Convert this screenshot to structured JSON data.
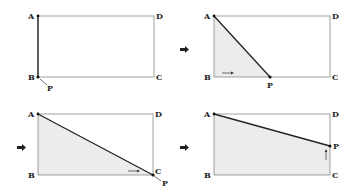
{
  "figure": {
    "colors": {
      "outline": "#8a8a8a",
      "segment": "#222222",
      "shade": "#ececec",
      "text": "#222222"
    },
    "panels": [
      {
        "id": "panel-1",
        "stage": "P at B",
        "labels": {
          "A": "A",
          "B": "B",
          "C": "C",
          "D": "D",
          "P": "P"
        },
        "motion_arrow": "none"
      },
      {
        "id": "panel-2",
        "stage": "P moving along BC",
        "labels": {
          "A": "A",
          "B": "B",
          "C": "C",
          "D": "D",
          "P": "P"
        },
        "motion_arrow": "right"
      },
      {
        "id": "panel-3",
        "stage": "P at C",
        "labels": {
          "A": "A",
          "B": "B",
          "C": "C",
          "D": "D",
          "P": "P"
        },
        "motion_arrow": "right"
      },
      {
        "id": "panel-4",
        "stage": "P moving along CD",
        "labels": {
          "A": "A",
          "B": "B",
          "C": "C",
          "D": "D",
          "P": "P"
        },
        "motion_arrow": "up"
      }
    ],
    "step_arrows": [
      "right-arrow",
      "right-arrow",
      "right-arrow"
    ]
  }
}
